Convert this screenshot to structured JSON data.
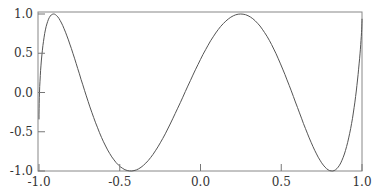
{
  "chart_data": {
    "type": "line",
    "title": "",
    "xlabel": "",
    "ylabel": "",
    "xlim": [
      -1.0,
      1.0
    ],
    "ylim": [
      -1.0,
      1.0
    ],
    "grid": false,
    "legend": null,
    "x_ticks": [
      "-1.0",
      "-0.5",
      "0.0",
      "0.5",
      "1.0"
    ],
    "y_ticks": [
      "1.0",
      "0.5",
      "0.0",
      "-0.5",
      "-1.0"
    ],
    "series": [
      {
        "name": "parametric curve (Lissajous-like)",
        "color": "#555555",
        "description": "x = cos(t), y = cos(9t) style curve; left turning points near y≈0.95, 0.6, 0.0, -0.55, -0.95; right turning points near y≈0.85, 0.35, -0.3, -0.85",
        "param": {
          "x_freq": 1,
          "y_freq": 9,
          "y_phase": 0.35,
          "samples": 200
        }
      }
    ]
  }
}
